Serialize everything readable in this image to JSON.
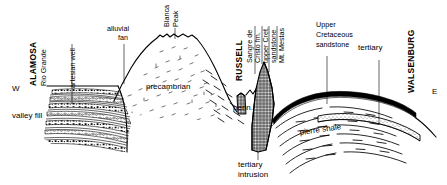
{
  "figure": {
    "background_color": "#ffffff",
    "line_color": "#000000",
    "width": 447,
    "height": 185
  },
  "compass": {
    "west": "W",
    "east": "E"
  },
  "places": [
    {
      "name": "ALAMOSA",
      "style": "bold-vertical"
    },
    {
      "name": "RUSSELL",
      "style": "bold-vertical"
    },
    {
      "name": "WALSENBURG",
      "style": "bold-vertical"
    }
  ],
  "city_labels": {
    "alamosa": "ALAMOSA",
    "russell": "RUSSELL",
    "walsenburg": "WALSENBURG"
  },
  "feature_labels": {
    "rio_grande": "Rio Grande",
    "artesian_well": "artesian well",
    "alluvial_fan_line1": "alluvial",
    "alluvial_fan_line2": "fan",
    "blanca_peak_line1": "Blanca",
    "blanca_peak_line2": "Peak",
    "valley_fill": "valley fill",
    "precambrian": "precambrian",
    "penn": "penn.",
    "sangre_de_cristo_line1": "Sangre de",
    "sangre_de_cristo_line2": "Cristo fm.",
    "upper_cret_line1": "upper Cret.",
    "upper_cret_line2": "sandstone",
    "mt_mestas": "Mt. Mestas",
    "upper_cretaceous_line1": "Upper",
    "upper_cretaceous_line2": "Cretaceous",
    "upper_cretaceous_line3": "sandstone",
    "tertiary": "tertiary",
    "pierre_shale": "pierre shale",
    "tertiary_intrusion_line1": "tertiary",
    "tertiary_intrusion_line2": "intrusion"
  },
  "units": [
    {
      "id": "valley-fill",
      "label": "valley fill",
      "pattern": "conglomerate-bands"
    },
    {
      "id": "precambrian",
      "label": "precambrian",
      "pattern": "dash-stipple"
    },
    {
      "id": "penn",
      "label": "penn.",
      "pattern": "crosshatch"
    },
    {
      "id": "pierre-shale",
      "label": "pierre shale",
      "pattern": "dashed-bedding"
    },
    {
      "id": "tertiary",
      "label": "tertiary",
      "pattern": "stipple-band"
    },
    {
      "id": "tertiary-intrusion",
      "label": "tertiary intrusion",
      "pattern": "crosshatch"
    },
    {
      "id": "upper-cretaceous-sandstone",
      "label": "Upper Cretaceous sandstone",
      "pattern": "solid-band"
    }
  ]
}
